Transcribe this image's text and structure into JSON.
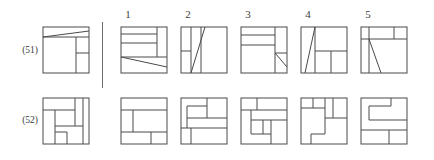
{
  "page": {
    "stroke_color": "#4a4a4a",
    "text_color": "#3d3d3d",
    "background": "#ffffff"
  },
  "column_headers": [
    {
      "label": "1",
      "x": 128
    },
    {
      "label": "2",
      "x": 188
    },
    {
      "label": "3",
      "x": 248
    },
    {
      "label": "4",
      "x": 308
    },
    {
      "label": "5",
      "x": 368
    }
  ],
  "divider": {
    "x": 102,
    "y": 22,
    "height": 66
  },
  "rows": [
    {
      "id": "row-51",
      "label": "(51)",
      "label_y": 45,
      "y": 26,
      "prompt": {
        "name": "prompt-figure-51",
        "x": 42,
        "size": 46,
        "lines": [
          [
            0,
            10,
            46,
            10
          ],
          [
            0,
            10,
            46,
            4
          ],
          [
            33,
            10,
            33,
            46
          ],
          [
            33,
            26,
            46,
            26
          ]
        ]
      },
      "options": [
        {
          "number": "1",
          "name": "option-51-1",
          "x": 120,
          "size": 46,
          "lines": [
            [
              0,
              7,
              36,
              7
            ],
            [
              0,
              16,
              36,
              16
            ],
            [
              36,
              0,
              36,
              30
            ],
            [
              0,
              30,
              46,
              30
            ],
            [
              0,
              30,
              46,
              40
            ]
          ]
        },
        {
          "number": "2",
          "name": "option-51-2",
          "x": 180,
          "size": 46,
          "lines": [
            [
              10,
              0,
              10,
              46
            ],
            [
              0,
              24,
              10,
              24
            ],
            [
              20,
              0,
              20,
              46
            ],
            [
              10,
              46,
              24,
              0
            ]
          ]
        },
        {
          "number": "3",
          "name": "option-51-3",
          "x": 240,
          "size": 46,
          "lines": [
            [
              0,
              8,
              34,
              8
            ],
            [
              0,
              18,
              34,
              18
            ],
            [
              34,
              0,
              34,
              46
            ],
            [
              34,
              26,
              46,
              26
            ],
            [
              34,
              26,
              46,
              40
            ]
          ]
        },
        {
          "number": "4",
          "name": "option-51-4",
          "x": 300,
          "size": 46,
          "lines": [
            [
              4,
              46,
              14,
              0
            ],
            [
              14,
              0,
              14,
              46
            ],
            [
              14,
              24,
              46,
              24
            ],
            [
              30,
              24,
              30,
              46
            ]
          ]
        },
        {
          "number": "5",
          "name": "option-51-5",
          "x": 360,
          "size": 46,
          "lines": [
            [
              0,
              12,
              46,
              12
            ],
            [
              33,
              0,
              33,
              12
            ],
            [
              8,
              0,
              8,
              46
            ],
            [
              8,
              12,
              20,
              46
            ]
          ]
        }
      ]
    },
    {
      "id": "row-52",
      "label": "(52)",
      "label_y": 115,
      "y": 97,
      "prompt": {
        "name": "prompt-figure-52",
        "x": 42,
        "size": 46,
        "lines": [
          [
            0,
            12,
            32,
            12
          ],
          [
            32,
            0,
            32,
            12
          ],
          [
            12,
            12,
            12,
            46
          ],
          [
            12,
            34,
            24,
            34
          ],
          [
            24,
            34,
            24,
            46
          ],
          [
            32,
            12,
            32,
            28
          ],
          [
            12,
            28,
            40,
            28
          ],
          [
            40,
            0,
            40,
            46
          ]
        ]
      },
      "options": [
        {
          "number": "1",
          "name": "option-52-1",
          "x": 120,
          "size": 46,
          "lines": [
            [
              0,
              12,
              12,
              12
            ],
            [
              12,
              12,
              12,
              34
            ],
            [
              12,
              12,
              46,
              12
            ],
            [
              12,
              34,
              46,
              34
            ],
            [
              30,
              34,
              30,
              46
            ],
            [
              0,
              34,
              12,
              34
            ]
          ]
        },
        {
          "number": "2",
          "name": "option-52-2",
          "x": 180,
          "size": 46,
          "lines": [
            [
              6,
              8,
              26,
              8
            ],
            [
              26,
              0,
              26,
              20
            ],
            [
              6,
              8,
              6,
              30
            ],
            [
              6,
              20,
              46,
              20
            ],
            [
              0,
              30,
              46,
              30
            ],
            [
              10,
              30,
              10,
              46
            ],
            [
              6,
              8,
              6,
              8
            ]
          ]
        },
        {
          "number": "3",
          "name": "option-52-3",
          "x": 240,
          "size": 46,
          "lines": [
            [
              0,
              12,
              46,
              12
            ],
            [
              16,
              0,
              16,
              12
            ],
            [
              10,
              12,
              10,
              36
            ],
            [
              10,
              22,
              22,
              22
            ],
            [
              22,
              22,
              22,
              36
            ],
            [
              10,
              36,
              30,
              36
            ],
            [
              30,
              22,
              30,
              46
            ],
            [
              22,
              22,
              46,
              22
            ]
          ]
        },
        {
          "number": "4",
          "name": "option-52-4",
          "x": 300,
          "size": 46,
          "lines": [
            [
              12,
              0,
              12,
              10
            ],
            [
              0,
              10,
              24,
              10
            ],
            [
              24,
              0,
              24,
              36
            ],
            [
              10,
              36,
              24,
              36
            ],
            [
              10,
              36,
              10,
              46
            ],
            [
              24,
              20,
              46,
              20
            ],
            [
              32,
              0,
              32,
              20
            ],
            [
              24,
              10,
              24,
              10
            ]
          ]
        },
        {
          "number": "5",
          "name": "option-52-5",
          "x": 360,
          "size": 46,
          "lines": [
            [
              8,
              8,
              30,
              8
            ],
            [
              30,
              0,
              30,
              8
            ],
            [
              8,
              8,
              8,
              22
            ],
            [
              8,
              22,
              46,
              22
            ],
            [
              0,
              32,
              46,
              32
            ],
            [
              28,
              32,
              28,
              46
            ]
          ]
        }
      ]
    }
  ]
}
